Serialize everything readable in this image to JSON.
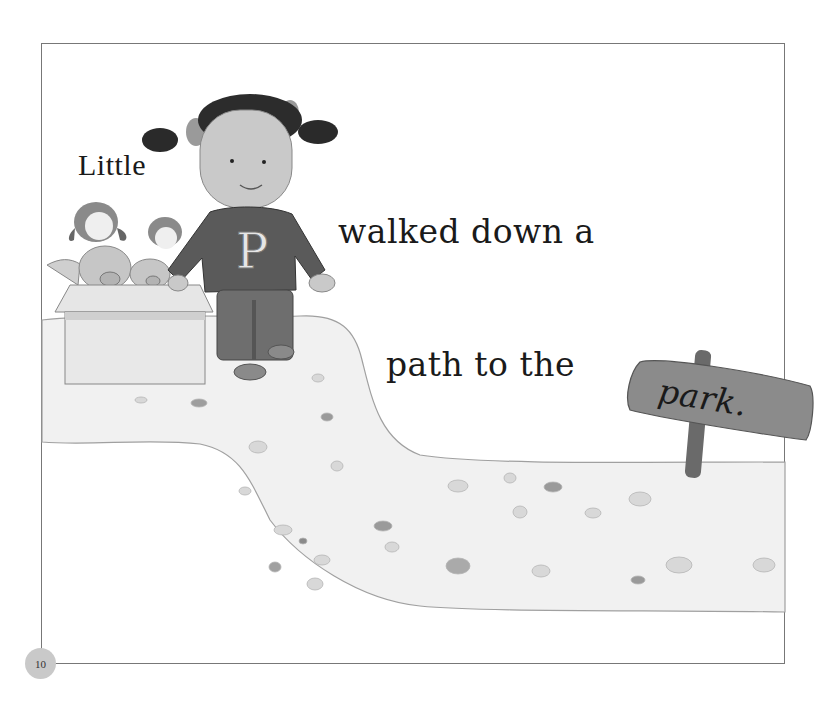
{
  "page": {
    "number": "10",
    "text_words": {
      "little": "Little",
      "walked": "walked down a",
      "path": "path to the",
      "park": "park."
    },
    "illustration": {
      "character": "girl in sweater with letter P",
      "sweater_letter": "P",
      "box_contents": "toy dogs and pigs in a cardboard box",
      "sign_text": "park."
    }
  },
  "colors": {
    "frame_border": "#777777",
    "page_number_bg": "#c9c9c9",
    "path_fill": "#f2f2f2",
    "path_edge": "#9a9a9a",
    "sign_wood": "#7d7d7d",
    "sweater": "#5a5a5a",
    "pants": "#6e6e6e",
    "skin": "#c8c8c8",
    "hair": "#2a2a2a"
  }
}
